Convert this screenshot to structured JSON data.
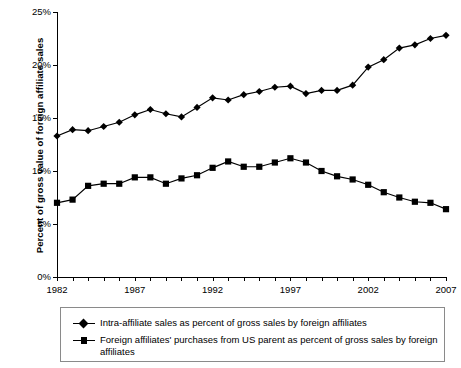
{
  "chart_data": {
    "type": "line",
    "title": "",
    "xlabel": "",
    "ylabel": "Percent of gross value of foreign affiliate sales",
    "xlim": [
      1982,
      2007
    ],
    "ylim": [
      0,
      25
    ],
    "ytick_values": [
      0,
      5,
      10,
      15,
      20,
      25
    ],
    "ytick_labels": [
      "0%",
      "5%",
      "10%",
      "15%",
      "20%",
      "25%"
    ],
    "xtick_labels": [
      "1982",
      "1987",
      "1992",
      "1997",
      "2002",
      "2007"
    ],
    "xtick_label_values": [
      1982,
      1987,
      1992,
      1997,
      2002,
      2007
    ],
    "x": [
      1982,
      1983,
      1984,
      1985,
      1986,
      1987,
      1988,
      1989,
      1990,
      1991,
      1992,
      1993,
      1994,
      1995,
      1996,
      1997,
      1998,
      1999,
      2000,
      2001,
      2002,
      2003,
      2004,
      2005,
      2006,
      2007
    ],
    "grid": false,
    "legend_position": "below",
    "series": [
      {
        "name": "Intra-affiliate sales as percent of gross sales by foreign affiliates",
        "marker": "diamond",
        "color": "#000000",
        "values": [
          13.3,
          13.9,
          13.8,
          14.2,
          14.6,
          15.3,
          15.8,
          15.4,
          15.1,
          16.0,
          16.9,
          16.7,
          17.2,
          17.5,
          17.9,
          18.0,
          17.3,
          17.6,
          17.6,
          18.1,
          19.8,
          20.5,
          21.6,
          21.9,
          22.5,
          22.8
        ]
      },
      {
        "name": "Foreign affiliates' purchases from US parent as percent of gross sales by foreign affiliates",
        "marker": "square",
        "color": "#000000",
        "values": [
          7.0,
          7.3,
          8.6,
          8.8,
          8.8,
          9.4,
          9.4,
          8.8,
          9.3,
          9.6,
          10.3,
          10.9,
          10.4,
          10.4,
          10.8,
          11.2,
          10.8,
          10.0,
          9.5,
          9.2,
          8.7,
          8.0,
          7.5,
          7.1,
          7.0,
          6.4
        ]
      }
    ]
  },
  "legend": {
    "items": [
      {
        "label": "Intra-affiliate sales as percent of gross sales by foreign affiliates",
        "marker": "diamond-marker-icon"
      },
      {
        "label": "Foreign affiliates' purchases from US parent as percent of gross sales by foreign affiliates",
        "marker": "square-marker-icon"
      }
    ]
  }
}
